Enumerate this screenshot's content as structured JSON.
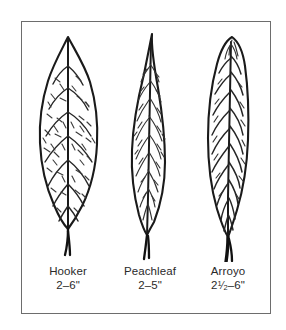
{
  "figure": {
    "kind": "botanical-leaf-comparison-plate",
    "frame_color": "#6d6d6d",
    "ink_color": "#1a1a1a",
    "background_color": "#ffffff"
  },
  "leaves": [
    {
      "id": "hooker",
      "name": "Hooker",
      "size": "2–6\"",
      "shape": "broad ovate to elliptic, rounded base, short acute tip",
      "venation": "irregular reticulate net of short dashes"
    },
    {
      "id": "peachleaf",
      "name": "Peachleaf",
      "size": "2–5\"",
      "shape": "narrow lanceolate, long tapered sharp tip",
      "venation": "fine parallel angled dashes"
    },
    {
      "id": "arroyo",
      "name": "Arroyo",
      "size_display": {
        "whole": "2",
        "numerator": "1",
        "slash": "⁄",
        "denominator": "2",
        "range": "–6\"",
        "plain": "2 1/2–6\""
      },
      "shape": "narrow oblong-lanceolate, blunt curved tip, long stout petiole",
      "venation": "bold continuous herringbone veins"
    }
  ]
}
